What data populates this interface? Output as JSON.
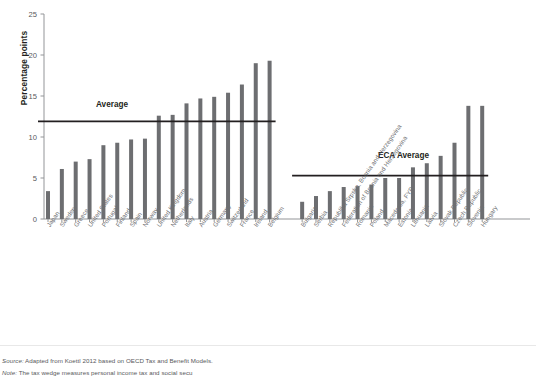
{
  "figure": {
    "y_axis_title": "Percentage points",
    "avg_label": "Average",
    "eca_avg_label": "ECA Average",
    "source_lead": "Source:",
    "source_text": " Adapted from Koettl 2012 based on OECD Tax and Benefit Models.",
    "note_lead": "Note:",
    "note_text": " The tax wedge measures personal income tax and social secu"
  },
  "colors": {
    "bar": "#6d6e71",
    "axis": "#939598",
    "average_line": "#231f20",
    "tick_text": "#58595b",
    "label_text": "#6d6e71",
    "background": "#ffffff"
  },
  "chart_data": {
    "type": "bar",
    "title": "",
    "subtitle": "",
    "xlabel": "",
    "ylabel": "Percentage points",
    "ylim": [
      0,
      25
    ],
    "yticks": [
      0,
      5,
      10,
      15,
      20,
      25
    ],
    "ytick_labels": [
      "0",
      "5",
      "10",
      "15",
      "20",
      "25"
    ],
    "grid": false,
    "legend_position": "none",
    "groups": [
      {
        "name": "OECD comparators",
        "reference_line": {
          "label": "Average",
          "value": 11.9
        },
        "categories": [
          "Japan",
          "Sweden",
          "Greece",
          "United States",
          "Portugal",
          "Finland",
          "Spain",
          "Norway",
          "United Kingdom",
          "Netherlands",
          "Italy",
          "Austria",
          "Germany",
          "Switzerland",
          "France",
          "Ireland",
          "Belgium"
        ],
        "values": [
          3.4,
          6.1,
          7.0,
          7.3,
          9.0,
          9.3,
          9.7,
          9.8,
          12.6,
          12.7,
          14.1,
          14.7,
          14.9,
          15.4,
          16.4,
          19.0,
          19.3
        ]
      },
      {
        "name": "ECA countries",
        "reference_line": {
          "label": "ECA Average",
          "value": 5.3
        },
        "categories": [
          "Bulgaria",
          "Serbia",
          "Republika Srpska, Bosnia and Herzegovina",
          "Federation of Bosnia and Herzegovina",
          "Romania",
          "Poland",
          "Macedonia, FYR",
          "Estonia",
          "Lithuania",
          "Latvia",
          "Slovak Republic",
          "Czech Republic",
          "Slovenia",
          "Hungary"
        ],
        "values": [
          2.1,
          2.8,
          3.4,
          3.9,
          4.0,
          4.2,
          5.0,
          5.0,
          6.3,
          6.8,
          7.7,
          9.3,
          13.8,
          13.8
        ]
      }
    ]
  }
}
